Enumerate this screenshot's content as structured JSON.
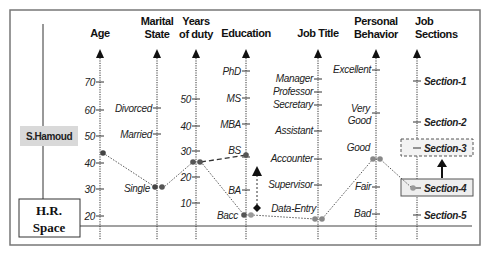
{
  "diagram": {
    "entity_label": "S.Hamoud",
    "root_label_line1": "H.R.",
    "root_label_line2": "Space",
    "axes": [
      {
        "id": "age",
        "title_lines": [
          "Age"
        ],
        "ticks": [
          "70",
          "60",
          "50",
          "40",
          "30",
          "20"
        ]
      },
      {
        "id": "marital",
        "title_lines": [
          "Marital",
          "State"
        ],
        "ticks": [
          "Divorced",
          "Married",
          "Single"
        ]
      },
      {
        "id": "years",
        "title_lines": [
          "Years",
          "of duty"
        ],
        "ticks": [
          "50",
          "40",
          "30",
          "20",
          "10"
        ]
      },
      {
        "id": "education",
        "title_lines": [
          "Education"
        ],
        "ticks": [
          "PhD",
          "MS",
          "MBA",
          "BS",
          "BA",
          "Bacc"
        ]
      },
      {
        "id": "job_title",
        "title_lines": [
          "Job Title"
        ],
        "ticks": [
          "Manager",
          "Professor",
          "Secretary",
          "Assistant",
          "Accounter",
          "Supervisor",
          "Data-Entry"
        ]
      },
      {
        "id": "behavior",
        "title_lines": [
          "Personal",
          "Behavior"
        ],
        "ticks": [
          "Excellent",
          "Very",
          "Good",
          "Good",
          "Fair",
          "Bad"
        ]
      },
      {
        "id": "sections",
        "title_lines": [
          "Job",
          "Sections"
        ],
        "ticks": [
          "Section-1",
          "Section-2",
          "Section-3",
          "Section-4",
          "Section-5"
        ]
      }
    ],
    "profile_values": {
      "age": "45",
      "marital": "Single",
      "years": "25",
      "education": "Bacc",
      "job_title": "Data-Entry",
      "behavior": "Good",
      "section": "Section-4"
    },
    "proposed": {
      "education": "BS",
      "section": "Section-3"
    },
    "colors": {
      "line": "#333333",
      "point": "#555555",
      "point_light": "#999999",
      "name_bg": "#d9d9d9",
      "section_box_bg": "#eeeeee"
    }
  }
}
